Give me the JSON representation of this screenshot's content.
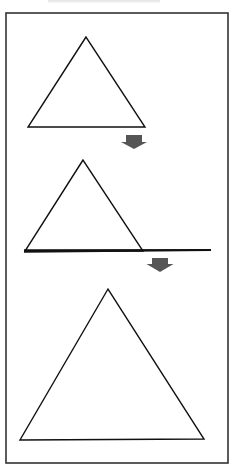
{
  "diagram": {
    "colors": {
      "background": "#ffffff",
      "frame": "#333333",
      "stroke": "#111111",
      "arrow": "#555555"
    },
    "frame": {
      "x1": 6,
      "y1": 13,
      "x2": 228,
      "y2": 463
    },
    "steps": [
      {
        "name": "triangle-1",
        "points": [
          [
            86,
            37
          ],
          [
            28,
            127
          ],
          [
            145,
            127
          ]
        ]
      },
      {
        "name": "triangle-2-on-line",
        "points": [
          [
            83,
            160
          ],
          [
            25,
            251
          ],
          [
            143,
            251
          ]
        ],
        "baseline": {
          "x1": 24,
          "y1": 251,
          "x2": 211,
          "y2": 250
        }
      },
      {
        "name": "triangle-3-large",
        "points": [
          [
            108,
            289
          ],
          [
            20,
            440
          ],
          [
            204,
            439
          ]
        ]
      }
    ],
    "arrows": [
      {
        "name": "arrow-1",
        "cx": 134,
        "top": 135,
        "shaft_w": 16,
        "shaft_h": 7,
        "head_w": 26,
        "tip": 149
      },
      {
        "name": "arrow-2",
        "cx": 160,
        "top": 258,
        "shaft_w": 16,
        "shaft_h": 6,
        "head_w": 27,
        "tip": 272
      }
    ]
  }
}
